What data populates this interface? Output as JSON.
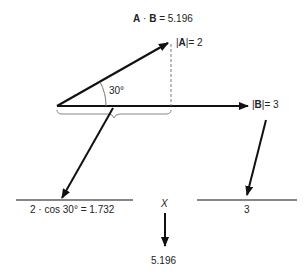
{
  "title": {
    "a": "A",
    "dot": " · ",
    "b": "B",
    "rest": " = 5.196"
  },
  "vector_a": {
    "name": "A",
    "magnitude_label": "= 2"
  },
  "vector_b": {
    "name": "B",
    "magnitude_label": "= 3"
  },
  "angle_label": "30°",
  "projection_label": "2 · cos 30° = 1.732",
  "magnitude_b_value": "3",
  "multiply_symbol": "X",
  "result": "5.196"
}
